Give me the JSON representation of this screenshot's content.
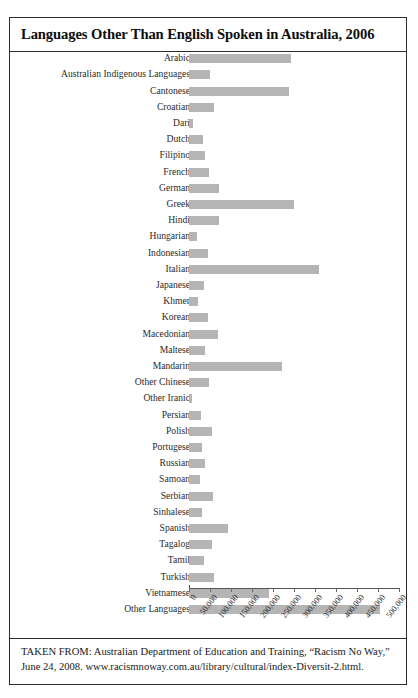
{
  "figure": {
    "title": "Languages Other Than English Spoken in Australia, 2006",
    "source_note": "TAKEN FROM: Australian Department of Education and Training, “Racism No Way,” June 24, 2008. www.racismnoway.com.au/library/cultural/index-Diversit-2.html."
  },
  "chart_data": {
    "type": "bar",
    "orientation": "horizontal",
    "title": "Languages Other Than English Spoken in Australia, 2006",
    "xlabel": "",
    "ylabel": "",
    "xlim": [
      0,
      500000
    ],
    "grid": false,
    "legend": null,
    "bar_color": "#b5b5b5",
    "tick_labels": [
      "0",
      "50,000",
      "100,000",
      "150,000",
      "200,000",
      "250,000",
      "300,000",
      "350,000",
      "400,000",
      "450,000",
      "500,000"
    ],
    "tick_values": [
      0,
      50000,
      100000,
      150000,
      200000,
      250000,
      300000,
      350000,
      400000,
      450000,
      500000
    ],
    "categories": [
      "Arabic",
      "Australian Indigenous Languages",
      "Cantonese",
      "Croatian",
      "Dari",
      "Dutch",
      "Filipino",
      "French",
      "German",
      "Greek",
      "Hindi",
      "Hungarian",
      "Indonesian",
      "Italian",
      "Japanese",
      "Khmer",
      "Korean",
      "Macedonian",
      "Maltese",
      "Mandarin",
      "Other Chinese",
      "Other Iranic",
      "Persian",
      "Polish",
      "Portugese",
      "Russian",
      "Samoan",
      "Serbian",
      "Sinhalese",
      "Spanish",
      "Tagalog",
      "Tamil",
      "Turkish",
      "Vietnamese",
      "Other Languages"
    ],
    "values": [
      244000,
      50000,
      238000,
      60000,
      9000,
      33000,
      38000,
      48000,
      72000,
      250000,
      72000,
      20000,
      45000,
      310000,
      36000,
      22000,
      45000,
      69000,
      37000,
      221000,
      47000,
      6000,
      29000,
      55000,
      30000,
      37000,
      26000,
      58000,
      30000,
      92000,
      55000,
      36000,
      60000,
      190000,
      455000
    ]
  }
}
